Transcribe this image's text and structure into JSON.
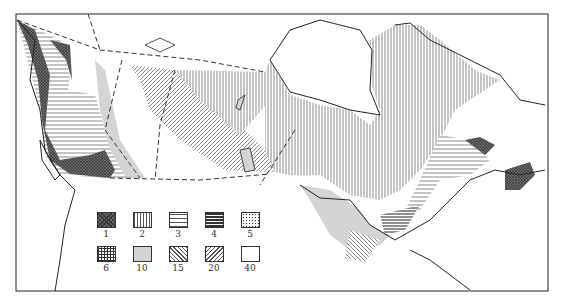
{
  "map": {
    "subject": "Canada regional map with patterned zones",
    "colors": {
      "background": "#ffffff",
      "outline": "#222222",
      "gray_fill": "#d4d4d4",
      "dark_fill": "#6a6a6a"
    }
  },
  "legend": {
    "items": [
      {
        "label": "1",
        "pattern": "dark-crosshatch"
      },
      {
        "label": "2",
        "pattern": "vertical-lines"
      },
      {
        "label": "3",
        "pattern": "horizontal-lines"
      },
      {
        "label": "4",
        "pattern": "dense-horizontal-lines"
      },
      {
        "label": "5",
        "pattern": "dots"
      },
      {
        "label": "6",
        "pattern": "grid"
      },
      {
        "label": "10",
        "pattern": "light-gray"
      },
      {
        "label": "15",
        "pattern": "diagonal-backslash"
      },
      {
        "label": "20",
        "pattern": "diagonal-slash"
      },
      {
        "label": "40",
        "pattern": "white"
      }
    ]
  }
}
